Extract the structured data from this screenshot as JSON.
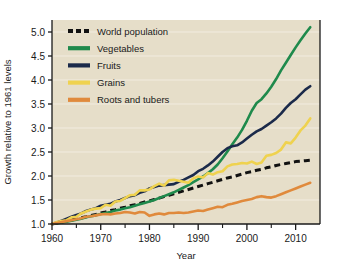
{
  "chart_data": {
    "type": "line",
    "title": "",
    "xlabel": "Year",
    "ylabel": "Growth relative to 1961 levels",
    "xlim": [
      1960,
      2015
    ],
    "ylim": [
      1.0,
      5.25
    ],
    "grid": true,
    "legend_position": "top-left",
    "plot_background": "#e6dec9",
    "x_ticks_major": [
      1960,
      1970,
      1980,
      1990,
      2000,
      2010
    ],
    "x_tick_labels": [
      "1960",
      "1970",
      "1980",
      "1990",
      "2000",
      "2010"
    ],
    "x_ticks_minor": [
      1965,
      1975,
      1985,
      1995,
      2005
    ],
    "y_ticks": [
      1.0,
      1.5,
      2.0,
      2.5,
      3.0,
      3.5,
      4.0,
      4.5,
      5.0
    ],
    "y_tick_labels": [
      "1.0",
      "1.5",
      "2.0",
      "2.5",
      "3.0",
      "3.5",
      "4.0",
      "4.5",
      "5.0"
    ],
    "x": [
      1960,
      1961,
      1962,
      1963,
      1964,
      1965,
      1966,
      1967,
      1968,
      1969,
      1970,
      1971,
      1972,
      1973,
      1974,
      1975,
      1976,
      1977,
      1978,
      1979,
      1980,
      1981,
      1982,
      1983,
      1984,
      1985,
      1986,
      1987,
      1988,
      1989,
      1990,
      1991,
      1992,
      1993,
      1994,
      1995,
      1996,
      1997,
      1998,
      1999,
      2000,
      2001,
      2002,
      2003,
      2004,
      2005,
      2006,
      2007,
      2008,
      2009,
      2010,
      2011,
      2012,
      2013
    ],
    "series": [
      {
        "name": "World population",
        "color": "#111111",
        "style": "dashed",
        "width": 3.0,
        "values": [
          1.0,
          1.02,
          1.04,
          1.06,
          1.08,
          1.11,
          1.13,
          1.15,
          1.18,
          1.2,
          1.23,
          1.25,
          1.28,
          1.3,
          1.33,
          1.35,
          1.38,
          1.4,
          1.43,
          1.46,
          1.48,
          1.51,
          1.54,
          1.57,
          1.6,
          1.63,
          1.66,
          1.69,
          1.72,
          1.75,
          1.78,
          1.81,
          1.84,
          1.87,
          1.9,
          1.93,
          1.96,
          1.98,
          2.01,
          2.04,
          2.07,
          2.09,
          2.12,
          2.14,
          2.17,
          2.19,
          2.22,
          2.24,
          2.26,
          2.28,
          2.3,
          2.31,
          2.32,
          2.33
        ]
      },
      {
        "name": "Vegetables",
        "color": "#1f8a4c",
        "style": "solid",
        "width": 2.6,
        "values": [
          1.0,
          1.01,
          1.03,
          1.05,
          1.07,
          1.09,
          1.11,
          1.14,
          1.16,
          1.18,
          1.21,
          1.23,
          1.25,
          1.28,
          1.3,
          1.33,
          1.35,
          1.38,
          1.41,
          1.44,
          1.47,
          1.5,
          1.54,
          1.58,
          1.62,
          1.66,
          1.71,
          1.76,
          1.81,
          1.87,
          1.93,
          1.99,
          2.06,
          2.14,
          2.24,
          2.37,
          2.51,
          2.66,
          2.8,
          2.96,
          3.15,
          3.36,
          3.52,
          3.6,
          3.72,
          3.86,
          4.02,
          4.2,
          4.36,
          4.52,
          4.68,
          4.83,
          4.97,
          5.1
        ]
      },
      {
        "name": "Fruits",
        "color": "#1b2a4a",
        "style": "solid",
        "width": 2.6,
        "values": [
          1.0,
          1.03,
          1.07,
          1.11,
          1.15,
          1.19,
          1.22,
          1.27,
          1.3,
          1.33,
          1.38,
          1.4,
          1.42,
          1.47,
          1.5,
          1.54,
          1.58,
          1.6,
          1.65,
          1.68,
          1.74,
          1.77,
          1.8,
          1.81,
          1.82,
          1.83,
          1.88,
          1.92,
          1.97,
          2.02,
          2.1,
          2.15,
          2.22,
          2.3,
          2.4,
          2.5,
          2.58,
          2.62,
          2.64,
          2.7,
          2.78,
          2.86,
          2.93,
          2.98,
          3.05,
          3.12,
          3.2,
          3.3,
          3.42,
          3.52,
          3.6,
          3.7,
          3.8,
          3.87
        ]
      },
      {
        "name": "Grains",
        "color": "#efd24f",
        "style": "solid",
        "width": 2.6,
        "values": [
          1.0,
          1.04,
          1.06,
          1.08,
          1.14,
          1.15,
          1.22,
          1.26,
          1.3,
          1.32,
          1.33,
          1.4,
          1.38,
          1.47,
          1.48,
          1.54,
          1.6,
          1.61,
          1.7,
          1.7,
          1.72,
          1.79,
          1.84,
          1.8,
          1.91,
          1.92,
          1.9,
          1.88,
          1.86,
          1.95,
          1.99,
          1.97,
          2.06,
          2.03,
          2.08,
          2.1,
          2.2,
          2.24,
          2.25,
          2.27,
          2.26,
          2.3,
          2.25,
          2.28,
          2.42,
          2.44,
          2.48,
          2.55,
          2.7,
          2.68,
          2.8,
          2.95,
          3.05,
          3.2
        ]
      },
      {
        "name": "Roots and tubers",
        "color": "#e08a3c",
        "style": "solid",
        "width": 2.6,
        "values": [
          1.0,
          1.02,
          1.04,
          1.06,
          1.08,
          1.1,
          1.12,
          1.15,
          1.16,
          1.18,
          1.2,
          1.21,
          1.2,
          1.22,
          1.23,
          1.25,
          1.24,
          1.22,
          1.25,
          1.24,
          1.17,
          1.2,
          1.22,
          1.2,
          1.23,
          1.23,
          1.24,
          1.23,
          1.24,
          1.26,
          1.28,
          1.27,
          1.3,
          1.33,
          1.36,
          1.35,
          1.4,
          1.42,
          1.45,
          1.48,
          1.5,
          1.52,
          1.56,
          1.58,
          1.56,
          1.55,
          1.58,
          1.62,
          1.66,
          1.7,
          1.74,
          1.78,
          1.82,
          1.86
        ]
      }
    ],
    "legend": [
      {
        "label": "World population",
        "color": "#111111",
        "style": "dashed"
      },
      {
        "label": "Vegetables",
        "color": "#1f8a4c",
        "style": "solid"
      },
      {
        "label": "Fruits",
        "color": "#1b2a4a",
        "style": "solid"
      },
      {
        "label": "Grains",
        "color": "#efd24f",
        "style": "solid"
      },
      {
        "label": "Roots and tubers",
        "color": "#e08a3c",
        "style": "solid"
      }
    ]
  }
}
